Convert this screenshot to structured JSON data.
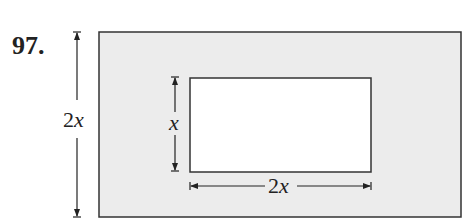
{
  "problem": {
    "number": "97.",
    "outer_height_label": {
      "coef": "2",
      "var": "x"
    },
    "inner_height_label": {
      "coef": "",
      "var": "x"
    },
    "inner_width_label": {
      "coef": "2",
      "var": "x"
    }
  },
  "colors": {
    "outer_fill": "#ececec",
    "inner_fill": "#ffffff",
    "stroke": "#333333"
  }
}
